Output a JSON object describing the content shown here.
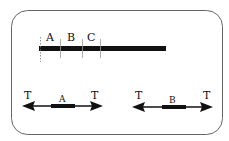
{
  "diagram": {
    "frame": {
      "stroke": "#666666",
      "fill": "#ffffff"
    },
    "top_bar": {
      "color": "#111111",
      "segment_labels": [
        "A",
        "B",
        "C"
      ]
    },
    "bottom_left": {
      "center_label": "A",
      "left_label": "T",
      "right_label": "T"
    },
    "bottom_right": {
      "center_label": "B",
      "left_label": "T",
      "right_label": "T"
    }
  }
}
